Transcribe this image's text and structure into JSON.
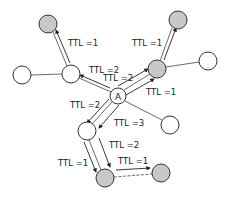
{
  "diagram": {
    "type": "network flooding with TTL",
    "source_node": {
      "label": "A"
    },
    "labels": {
      "l1": "TTL =1",
      "l2": "TTL =1",
      "l3": "TTL =2",
      "l4": "TTL =2",
      "l5": "TTL =1",
      "l6": "TTL =2",
      "l7": "TTL =3",
      "l8": "TTL =2",
      "l9": "TTL =1",
      "l10": "TTL =1"
    },
    "colors": {
      "reached_node": "#c8c8c8",
      "unreached_node": "#ffffff",
      "stroke": "#333333"
    }
  }
}
